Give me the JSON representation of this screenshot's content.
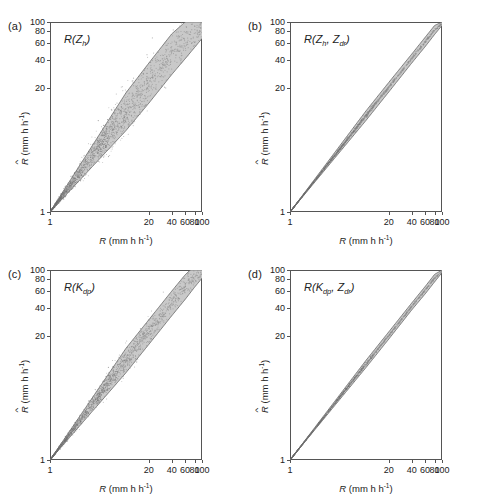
{
  "figure": {
    "layout": "2x2 grid of log-log scatter panels",
    "axis": {
      "x_label_var": "R",
      "x_label_units": "(mm h",
      "x_label_exp": "-1",
      "y_label_var": "R",
      "y_label_units": "(mm h",
      "y_label_exp": "-1",
      "ticks": [
        "1",
        "20",
        "40",
        "60",
        "80",
        "100"
      ],
      "scale": "log",
      "min": 1,
      "max": 100
    },
    "band_color": "#c9c9c9",
    "line_color": "#555555",
    "point_color": "#8c8c8c"
  },
  "panels": [
    {
      "letter": "(a)",
      "label_main": "R",
      "label_sub1": "Z",
      "label_sub1_sub": "h",
      "label_sub2": "",
      "label_sub2_sub": ""
    },
    {
      "letter": "(b)",
      "label_main": "R",
      "label_sub1": "Z",
      "label_sub1_sub": "h",
      "label_sub2": "Z",
      "label_sub2_sub": "dr"
    },
    {
      "letter": "(c)",
      "label_main": "R",
      "label_sub1": "K",
      "label_sub1_sub": "dp",
      "label_sub2": "",
      "label_sub2_sub": ""
    },
    {
      "letter": "(d)",
      "label_main": "R",
      "label_sub1": "K",
      "label_sub1_sub": "dp",
      "label_sub2": "Z",
      "label_sub2_sub": "dr"
    }
  ],
  "chart_data": {
    "type": "scatter",
    "title": "",
    "xlabel": "R (mm h^-1)",
    "ylabel": "R-hat (mm h^-1)",
    "xlim": [
      1,
      100
    ],
    "ylim": [
      1,
      100
    ],
    "xscale": "log",
    "yscale": "log",
    "grid": false,
    "legend": "none",
    "xticks": [
      1,
      20,
      40,
      60,
      80,
      100
    ],
    "yticks": [
      1,
      20,
      40,
      60,
      80,
      100
    ],
    "panels": [
      {
        "panel": "(a)",
        "estimator": "R(Z_h)",
        "band_upper_at_x": {
          "1": 1,
          "10": 18,
          "20": 37,
          "40": 75,
          "60": 100,
          "100": 100
        },
        "band_lower_at_x": {
          "1": 1,
          "10": 7.2,
          "20": 14,
          "40": 28,
          "60": 41,
          "80": 54,
          "100": 67
        },
        "band_description": "wide fan-shaped envelope opening from (1,1); upper bound saturates at 100 near x=58; lower bound reaches 67 at x=100",
        "scatter_spread": "very large; many outliers above the upper bound especially for x between 2 and 60",
        "n_points_visible": 1800
      },
      {
        "panel": "(b)",
        "estimator": "R(Z_h, Z_dr)",
        "band_upper_at_x": {
          "1": 1,
          "10": 11.6,
          "20": 23.2,
          "40": 46,
          "60": 69,
          "80": 92,
          "100": 100
        },
        "band_lower_at_x": {
          "1": 1,
          "10": 9.2,
          "20": 18.4,
          "40": 37,
          "60": 55,
          "80": 74,
          "100": 92
        },
        "band_description": "narrow band hugging the 1:1 line, width about +-12 percent",
        "scatter_spread": "small; points tightly clustered on the 1:1 line",
        "n_points_visible": 1600
      },
      {
        "panel": "(c)",
        "estimator": "R(K_dp)",
        "band_upper_at_x": {
          "1": 1,
          "10": 15,
          "20": 30,
          "40": 60,
          "60": 89,
          "70": 100,
          "100": 100
        },
        "band_lower_at_x": {
          "1": 1,
          "10": 8.3,
          "20": 16.5,
          "40": 33,
          "60": 49,
          "80": 66,
          "100": 82
        },
        "band_description": "moderately wide fan from (1,1); upper bound reaches 100 near x=68; lower bound reaches 82 at x=100",
        "scatter_spread": "moderate to large; outliers above the band at low to mid x",
        "n_points_visible": 1700
      },
      {
        "panel": "(d)",
        "estimator": "R(K_dp, Z_dr)",
        "band_upper_at_x": {
          "1": 1,
          "10": 11.2,
          "20": 22.4,
          "40": 45,
          "60": 67,
          "80": 90,
          "100": 100
        },
        "band_lower_at_x": {
          "1": 1,
          "10": 9.4,
          "20": 18.8,
          "40": 38,
          "60": 56,
          "80": 75,
          "100": 94
        },
        "band_description": "narrow band along the 1:1 line, slightly wider than panel b",
        "scatter_spread": "small; tight cluster on the 1:1 line",
        "n_points_visible": 1500
      }
    ]
  }
}
